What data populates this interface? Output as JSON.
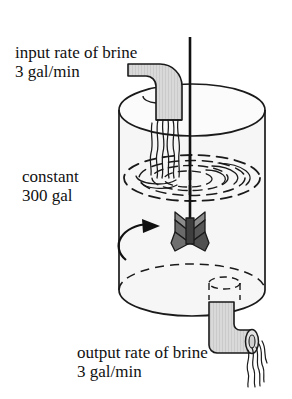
{
  "figure": {
    "labels": {
      "input_line1": "input rate of brine",
      "input_line2": "3 gal/min",
      "constant_line1": "constant",
      "constant_line2": "300 gal",
      "output_line1": "output rate of brine",
      "output_line2": "3 gal/min"
    },
    "parts": {
      "tank": "cylindrical-tank",
      "shaft": "stirrer-shaft",
      "impeller": "x-shaped-impeller",
      "inlet_pipe": "inlet-pipe",
      "outlet_pipe": "outlet-pipe",
      "ripples": "liquid-surface-ripples",
      "inflow_stream": "inflow-water-stream",
      "outflow_stream": "outflow-water-stream",
      "rotation_arrow": "stirring-rotation-arrow"
    },
    "colors": {
      "outline": "#1a1a1a",
      "tank_fill": "#f6f6f6",
      "pipe_fill": "#d6d6d6",
      "impeller_dark": "#5a5a5a",
      "impeller_light": "#8f8f8f",
      "background": "#ffffff",
      "text": "#111111"
    }
  }
}
